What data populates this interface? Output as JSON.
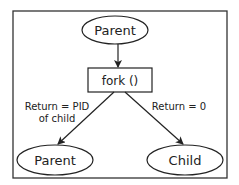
{
  "diagram": {
    "nodes": {
      "top_parent": {
        "label": "Parent",
        "shape": "ellipse"
      },
      "fork": {
        "label": "fork ()",
        "shape": "rectangle"
      },
      "bottom_parent": {
        "label": "Parent",
        "shape": "ellipse"
      },
      "child": {
        "label": "Child",
        "shape": "ellipse"
      }
    },
    "edges": {
      "to_fork": {
        "from": "top_parent",
        "to": "fork",
        "label": ""
      },
      "to_parent": {
        "from": "fork",
        "to": "bottom_parent",
        "label_line1": "Return = PID",
        "label_line2": "of child"
      },
      "to_child": {
        "from": "fork",
        "to": "child",
        "label": "Return = 0"
      }
    },
    "colors": {
      "stroke": "#222222",
      "background": "#ffffff"
    }
  }
}
